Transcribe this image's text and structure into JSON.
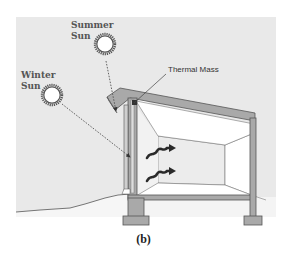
{
  "figure": {
    "labels": {
      "summer_sun": [
        "Summer",
        "Sun"
      ],
      "winter_sun": [
        "Winter",
        "Sun"
      ],
      "thermal_mass": "Thermal Mass"
    },
    "caption": "(b)",
    "icons": {
      "summer_sun": "sun-icon",
      "winter_sun": "sun-icon",
      "heat_waves": "heat-wave-icon"
    },
    "colors": {
      "sky": "#e9e9e9",
      "ground": "#f4f4f4",
      "structure": "#a9a9a9",
      "structure_stroke": "#555555",
      "interior_back_wall": "#ececec",
      "interior_side": "#ffffff",
      "ray": "#555555",
      "heat_wave": "#2a2a2a"
    }
  }
}
